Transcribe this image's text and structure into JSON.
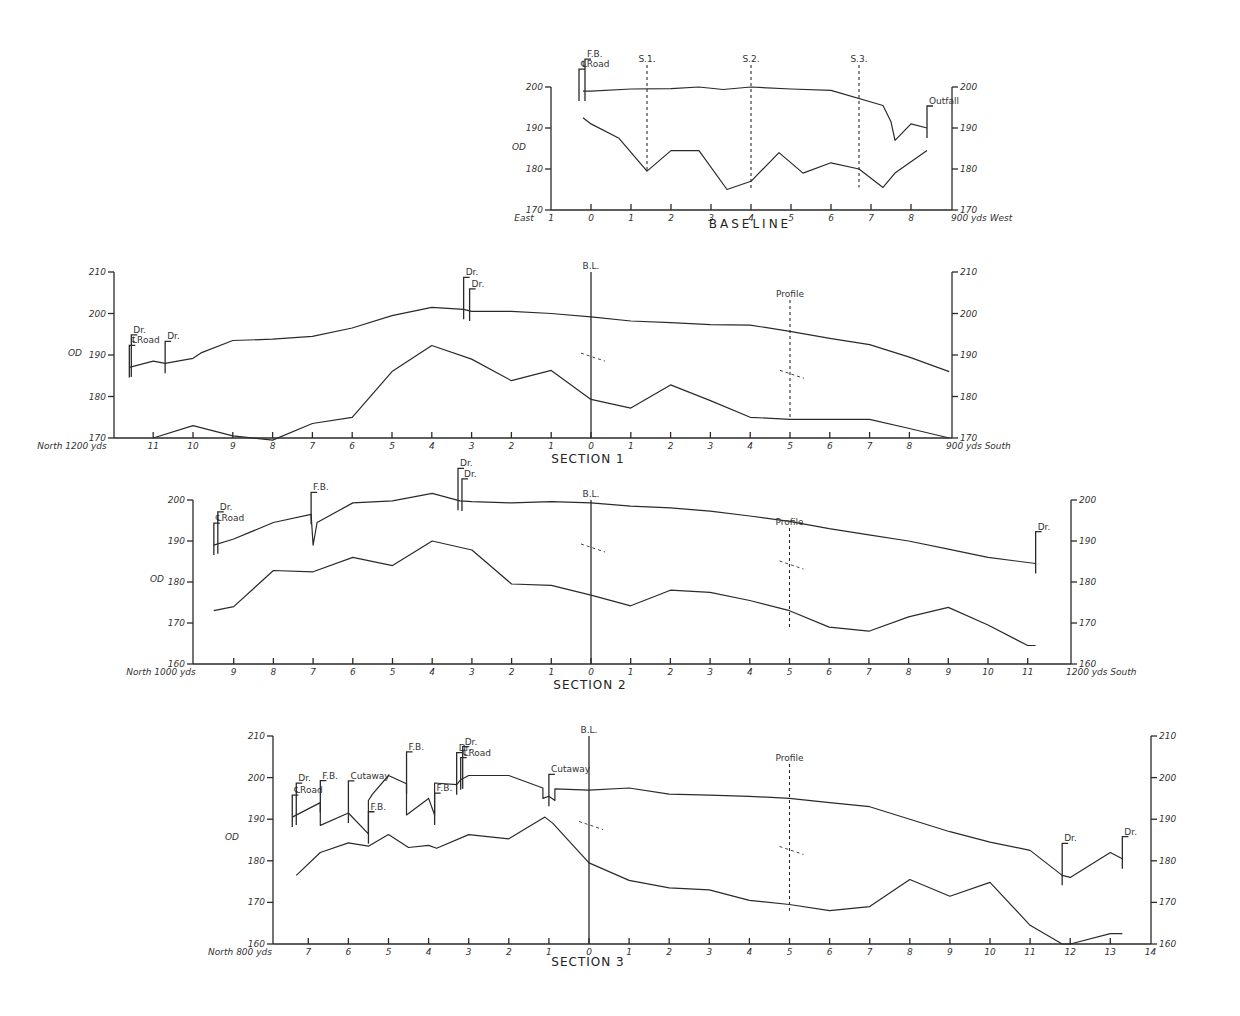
{
  "chart_data": [
    {
      "id": "baseline",
      "type": "line",
      "title": "BASELINE",
      "ylabel": "OD",
      "ylim": [
        170,
        200
      ],
      "yticks": [
        170,
        180,
        190,
        200
      ],
      "x_left_label": "East",
      "x_right_label": "900 yds West",
      "xticks": [
        "1",
        "0",
        "1",
        "2",
        "3",
        "4",
        "5",
        "6",
        "7",
        "8"
      ],
      "series": [
        {
          "name": "surface",
          "x": [
            -0.2,
            0,
            1,
            2,
            2.7,
            3.3,
            4,
            5,
            6,
            7.3,
            7.5,
            7.6,
            8,
            8.4
          ],
          "values": [
            199,
            199,
            199.5,
            199.6,
            200,
            199.4,
            200,
            199.5,
            199.2,
            195.5,
            191.5,
            187,
            191,
            190
          ]
        },
        {
          "name": "subsurface",
          "x": [
            -0.2,
            0,
            0.7,
            1.4,
            2,
            2.7,
            3.4,
            4,
            4.7,
            5.3,
            6,
            6.7,
            7.3,
            7.6,
            8.4
          ],
          "values": [
            192.5,
            191,
            187.5,
            179.5,
            184.5,
            184.5,
            175,
            177,
            184,
            179,
            181.5,
            180,
            175.5,
            179,
            184.5
          ]
        }
      ],
      "markers": [
        {
          "label": "℄Road",
          "x": -0.3
        },
        {
          "label": "F.B.",
          "x": -0.15
        },
        {
          "label": "S.1.",
          "x": 1.4,
          "type": "dashed-line"
        },
        {
          "label": "S.2.",
          "x": 4,
          "type": "dashed-line"
        },
        {
          "label": "S.3.",
          "x": 6.7,
          "type": "dashed-line"
        },
        {
          "label": "Outfall",
          "x": 8.4
        }
      ]
    },
    {
      "id": "section1",
      "type": "line",
      "title": "SECTION 1",
      "ylabel": "OD",
      "ylim": [
        170,
        210
      ],
      "yticks": [
        170,
        180,
        190,
        200,
        210
      ],
      "x_left_label": "North 1200 yds",
      "x_right_label": "900 yds South",
      "xticks": [
        "11",
        "10",
        "9",
        "8",
        "7",
        "6",
        "5",
        "4",
        "3",
        "2",
        "1",
        "0",
        "1",
        "2",
        "3",
        "4",
        "5",
        "6",
        "7",
        "8"
      ],
      "series": [
        {
          "name": "surface",
          "x": [
            -11.6,
            -11,
            -10.7,
            -10,
            -9.8,
            -9,
            -8,
            -7,
            -6,
            -5,
            -4,
            -3.2,
            -3,
            -2,
            -1,
            0,
            1,
            2,
            3,
            4,
            5,
            6,
            7,
            8,
            9
          ],
          "values": [
            187,
            188.5,
            188,
            189.2,
            190.5,
            193.5,
            193.8,
            194.5,
            196.5,
            199.5,
            201.5,
            201,
            200.5,
            200.5,
            200,
            199.2,
            198.2,
            197.8,
            197.3,
            197.2,
            195.7,
            194,
            192.5,
            189.5,
            186
          ]
        },
        {
          "name": "subsurface",
          "x": [
            -11,
            -10,
            -9,
            -8,
            -7,
            -6,
            -5,
            -4,
            -3,
            -2,
            -1,
            0,
            1,
            2,
            3,
            4,
            5,
            6,
            7,
            8,
            9
          ],
          "values": [
            170,
            173,
            170.5,
            169.5,
            173.5,
            175,
            186,
            192.3,
            189,
            183.8,
            186.3,
            179.3,
            177.2,
            182.8,
            179,
            175,
            174.5,
            174.5,
            174.5,
            172.3,
            170
          ]
        }
      ],
      "markers": [
        {
          "label": "℄Road",
          "x": -11.6
        },
        {
          "label": "Dr.",
          "x": -11.55
        },
        {
          "label": "Dr.",
          "x": -10.7
        },
        {
          "label": "Dr.",
          "x": -3.2
        },
        {
          "label": "Dr.",
          "x": -3.05
        },
        {
          "label": "B.L.",
          "x": 0,
          "type": "solid-line"
        },
        {
          "label": "Profile",
          "x": 5,
          "type": "dashed-line"
        }
      ]
    },
    {
      "id": "section2",
      "type": "line",
      "title": "SECTION 2",
      "ylabel": "OD",
      "ylim": [
        160,
        200
      ],
      "yticks": [
        160,
        170,
        180,
        190,
        200
      ],
      "x_left_label": "North 1000 yds",
      "x_right_label": "1200 yds South",
      "xticks": [
        "9",
        "8",
        "7",
        "6",
        "5",
        "4",
        "3",
        "2",
        "1",
        "0",
        "1",
        "2",
        "3",
        "4",
        "5",
        "6",
        "7",
        "8",
        "9",
        "10",
        "11"
      ],
      "series": [
        {
          "name": "surface",
          "x": [
            -9.5,
            -9,
            -8,
            -7.05,
            -7.0,
            -6.9,
            -6,
            -5,
            -4,
            -3.3,
            -3,
            -2,
            -1,
            0,
            1,
            2,
            3,
            4,
            5,
            6,
            7,
            8,
            9,
            10,
            11.2
          ],
          "values": [
            189,
            190.5,
            194.5,
            196.5,
            189,
            194.5,
            199.3,
            199.8,
            201.6,
            199.8,
            199.6,
            199.3,
            199.6,
            199.3,
            198.5,
            198.1,
            197.3,
            196.1,
            194.8,
            193,
            191.5,
            190,
            188,
            186,
            184.5
          ]
        },
        {
          "name": "subsurface",
          "x": [
            -9.5,
            -9,
            -8,
            -7,
            -6,
            -5,
            -4,
            -3,
            -2,
            -1,
            0,
            1,
            2,
            3,
            4,
            5,
            6,
            7,
            8,
            9,
            10,
            11,
            11.2
          ],
          "values": [
            173,
            174,
            182.8,
            182.5,
            186,
            184,
            190,
            187.8,
            179.5,
            179.2,
            176.8,
            174.2,
            178,
            177.5,
            175.5,
            173,
            169,
            168,
            171.5,
            173.8,
            169.5,
            164.5,
            164.5
          ]
        }
      ],
      "markers": [
        {
          "label": "℄Road",
          "x": -9.5
        },
        {
          "label": "Dr.",
          "x": -9.4
        },
        {
          "label": "F.B.",
          "x": -7.05
        },
        {
          "label": "Dr.",
          "x": -3.35
        },
        {
          "label": "Dr.",
          "x": -3.25
        },
        {
          "label": "B.L.",
          "x": 0,
          "type": "solid-line"
        },
        {
          "label": "Profile",
          "x": 5,
          "type": "dashed-line"
        },
        {
          "label": "Dr.",
          "x": 11.2
        }
      ]
    },
    {
      "id": "section3",
      "type": "line",
      "title": "SECTION 3",
      "ylabel": "OD",
      "ylim": [
        160,
        210
      ],
      "yticks": [
        160,
        170,
        180,
        190,
        200,
        210
      ],
      "x_left_label": "North 800 yds",
      "x_right_label": "",
      "xticks": [
        "7",
        "6",
        "5",
        "4",
        "3",
        "2",
        "1",
        "0",
        "1",
        "2",
        "3",
        "4",
        "5",
        "6",
        "7",
        "8",
        "9",
        "10",
        "11",
        "12",
        "13",
        "14"
      ],
      "series": [
        {
          "name": "surface",
          "x": [
            -7.4,
            -6.7,
            -6.7,
            -6,
            -5.5,
            -5.5,
            -5.4,
            -5,
            -4.55,
            -4.55,
            -4,
            -3.85,
            -3.85,
            -3.3,
            -3.2,
            -3,
            -2,
            -1.15,
            -1.15,
            -1,
            -0.85,
            -0.85,
            0,
            1,
            2,
            3,
            4,
            5,
            6,
            7,
            8,
            9,
            10,
            11,
            11.8,
            12,
            13,
            13.3
          ],
          "values": [
            190.5,
            194,
            188.5,
            191.5,
            186.5,
            194.5,
            196,
            200.5,
            198.5,
            191,
            195,
            191,
            198.7,
            198.3,
            199.5,
            200.5,
            200.5,
            197.5,
            195,
            195.5,
            194.5,
            197.3,
            197,
            197.5,
            196,
            195.8,
            195.5,
            195,
            194,
            193,
            190,
            187,
            184.5,
            182.5,
            176.5,
            176,
            182,
            180.5
          ]
        },
        {
          "name": "subsurface",
          "x": [
            -7.3,
            -6.7,
            -6,
            -5.5,
            -5,
            -4.5,
            -4,
            -3.8,
            -3,
            -2,
            -1.1,
            -0.9,
            0,
            1,
            2,
            3,
            4,
            5,
            6,
            7,
            8,
            9,
            10,
            11,
            11.8,
            12,
            13,
            13.3
          ],
          "values": [
            176.5,
            182,
            184.3,
            183.5,
            186.3,
            183.2,
            183.7,
            183,
            186.3,
            185.3,
            190.5,
            189,
            179.5,
            175.3,
            173.5,
            173,
            170.5,
            169.5,
            168,
            169,
            175.5,
            171.5,
            174.8,
            164.5,
            160,
            160,
            162.5,
            162.5
          ]
        }
      ],
      "markers": [
        {
          "label": "℄Road",
          "x": -7.4
        },
        {
          "label": "Dr.",
          "x": -7.3
        },
        {
          "label": "F.B.",
          "x": -6.7
        },
        {
          "label": "Cutaway",
          "x": -6
        },
        {
          "label": "F.B.",
          "x": -5.5
        },
        {
          "label": "F.B.",
          "x": -4.55
        },
        {
          "label": "F.B.",
          "x": -3.85
        },
        {
          "label": "Dr.",
          "x": -3.3
        },
        {
          "label": "℄Road",
          "x": -3.2
        },
        {
          "label": "Dr.",
          "x": -3.15
        },
        {
          "label": "Cutaway",
          "x": -1
        },
        {
          "label": "B.L.",
          "x": 0,
          "type": "solid-line"
        },
        {
          "label": "Profile",
          "x": 5,
          "type": "dashed-line"
        },
        {
          "label": "Dr.",
          "x": 11.8
        },
        {
          "label": "Dr.",
          "x": 13.3
        }
      ]
    }
  ],
  "labels": {
    "od": "OD",
    "baseline_title": "BASELINE",
    "section1_title": "SECTION 1",
    "section2_title": "SECTION 2",
    "section3_title": "SECTION 3",
    "east": "East",
    "west": "900 yds West",
    "s1_north": "North 1200 yds",
    "s1_south": "900 yds South",
    "s2_north": "North 1000 yds",
    "s2_south": "1200 yds South",
    "s3_north": "North 800 yds",
    "croad": "℄Road",
    "fb": "F.B.",
    "dr": "Dr.",
    "bl": "B.L.",
    "profile": "Profile",
    "outfall": "Outfall",
    "cutaway": "Cutaway",
    "s1": "S.1.",
    "s2": "S.2.",
    "s3": "S.3."
  }
}
